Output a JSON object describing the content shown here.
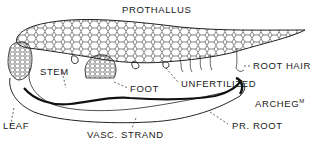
{
  "diagram": {
    "labels": {
      "prothallus": "PROTHALLUS",
      "stem": "STEM",
      "root_hair": "ROOT HAIR",
      "foot": "FOOT",
      "unfertilized": "UNFERTILIZED",
      "archegonium": "ARCHEG",
      "archegonium_sup": "M",
      "leaf": "LEAF",
      "vasc_strand": "VASC. STRAND",
      "pr_root": "PR. ROOT"
    },
    "colors": {
      "ink": "#1a1a1a",
      "background": "#ffffff"
    }
  }
}
